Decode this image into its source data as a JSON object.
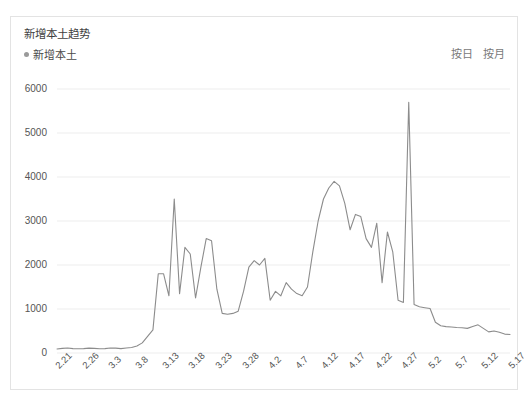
{
  "top_strip": {
    "clipped_text": ""
  },
  "card": {
    "title": "新增本土趋势",
    "legend": {
      "marker": "●",
      "label": "新增本土"
    },
    "tabs": [
      {
        "label": "按日",
        "active": true
      },
      {
        "label": "按月",
        "active": false
      }
    ]
  },
  "colors": {
    "line": "#8c8c8c",
    "grid": "#ededed",
    "axis_text": "#555555",
    "card_border": "#e3e3e3",
    "title_text": "#3f3f3f",
    "tab_text": "#7a7a7a",
    "background": "#ffffff"
  },
  "chart_data": {
    "type": "line",
    "title": "新增本土趋势",
    "xlabel": "",
    "ylabel": "",
    "ylim": [
      0,
      6000
    ],
    "ytick_values": [
      0,
      1000,
      2000,
      3000,
      4000,
      5000,
      6000
    ],
    "ytick_labels": [
      "0",
      "1000",
      "2000",
      "3000",
      "4000",
      "5000",
      "6000"
    ],
    "grid": true,
    "legend_position": "top-left",
    "xtick_labels": [
      "2.21",
      "2.26",
      "3.3",
      "3.8",
      "3.13",
      "3.18",
      "3.23",
      "3.28",
      "4.2",
      "4.7",
      "4.12",
      "4.17",
      "4.22",
      "4.27",
      "5.2",
      "5.7",
      "5.12",
      "5.17"
    ],
    "xtick_indices": [
      0,
      5,
      10,
      15,
      20,
      25,
      30,
      35,
      40,
      45,
      50,
      55,
      60,
      65,
      70,
      75,
      80,
      85
    ],
    "series": [
      {
        "name": "新增本土",
        "x": [
          "2.21",
          "2.22",
          "2.23",
          "2.24",
          "2.25",
          "2.26",
          "2.27",
          "2.28",
          "3.1",
          "3.2",
          "3.3",
          "3.4",
          "3.5",
          "3.6",
          "3.7",
          "3.8",
          "3.9",
          "3.10",
          "3.11",
          "3.12",
          "3.13",
          "3.14",
          "3.15",
          "3.16",
          "3.17",
          "3.18",
          "3.19",
          "3.20",
          "3.21",
          "3.22",
          "3.23",
          "3.24",
          "3.25",
          "3.26",
          "3.27",
          "3.28",
          "3.29",
          "3.30",
          "3.31",
          "4.1",
          "4.2",
          "4.3",
          "4.4",
          "4.5",
          "4.6",
          "4.7",
          "4.8",
          "4.9",
          "4.10",
          "4.11",
          "4.12",
          "4.13",
          "4.14",
          "4.15",
          "4.16",
          "4.17",
          "4.18",
          "4.19",
          "4.20",
          "4.21",
          "4.22",
          "4.23",
          "4.24",
          "4.25",
          "4.26",
          "4.27",
          "4.28",
          "4.29",
          "4.30",
          "5.1",
          "5.2",
          "5.3",
          "5.4",
          "5.5",
          "5.6",
          "5.7",
          "5.8",
          "5.9",
          "5.10",
          "5.11",
          "5.12",
          "5.13",
          "5.14",
          "5.15",
          "5.16",
          "5.17"
        ],
        "values": [
          90,
          105,
          115,
          100,
          95,
          100,
          110,
          105,
          95,
          100,
          115,
          110,
          100,
          115,
          125,
          160,
          230,
          380,
          525,
          1800,
          1800,
          1300,
          3500,
          1350,
          2400,
          2250,
          1250,
          1950,
          2600,
          2550,
          1450,
          900,
          880,
          900,
          950,
          1400,
          1950,
          2100,
          2000,
          2150,
          1200,
          1400,
          1300,
          1600,
          1450,
          1350,
          1300,
          1500,
          2300,
          3000,
          3500,
          3750,
          3900,
          3800,
          3400,
          2800,
          3150,
          3100,
          2600,
          2400,
          2950,
          1600,
          2750,
          2300,
          1200,
          1150,
          5700,
          1100,
          1050,
          1030,
          1010,
          700,
          620,
          600,
          590,
          580,
          575,
          560,
          600,
          640,
          560,
          480,
          500,
          470,
          430,
          420
        ]
      }
    ]
  }
}
